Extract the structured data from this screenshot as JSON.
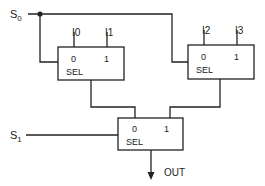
{
  "diagram": {
    "signals": {
      "s0": {
        "main": "S",
        "sub": "0"
      },
      "s1": {
        "main": "S",
        "sub": "1"
      },
      "output": "OUT"
    },
    "muxes": [
      {
        "id": "mux-a",
        "inputs": [
          "I0",
          "I1"
        ],
        "port0": "0",
        "port1": "1",
        "sel": "SEL"
      },
      {
        "id": "mux-b",
        "inputs": [
          "I2",
          "I3"
        ],
        "port0": "0",
        "port1": "1",
        "sel": "SEL"
      },
      {
        "id": "mux-c",
        "inputs": [],
        "port0": "0",
        "port1": "1",
        "sel": "SEL"
      }
    ],
    "colors": {
      "line": "#222222",
      "background": "#ffffff"
    }
  }
}
